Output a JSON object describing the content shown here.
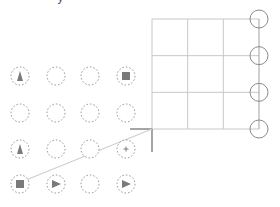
{
  "canvas": {
    "top_fragment": "y",
    "colors": {
      "grid_line": "#c8c8c8",
      "handle_circle": "#8a8a8a",
      "dashed_circle": "#8f8f8f",
      "glyph_fill": "#7a7a7a",
      "corner_marker": "#6a6a6a",
      "connector": "#cfcfcf"
    }
  },
  "grid": {
    "rows": 3,
    "columns": 3,
    "right_handles": 4
  },
  "palette": {
    "rows": [
      [
        "triangle-up",
        "empty",
        "empty",
        "square"
      ],
      [
        "empty",
        "empty",
        "empty",
        "empty"
      ],
      [
        "triangle-up",
        "empty",
        "empty",
        "plus"
      ],
      [
        "square",
        "triangle-right",
        "empty",
        "triangle-right"
      ]
    ]
  },
  "connector": {
    "from": "palette.rows.3.0",
    "to": "grid-bottom-left-corner"
  }
}
